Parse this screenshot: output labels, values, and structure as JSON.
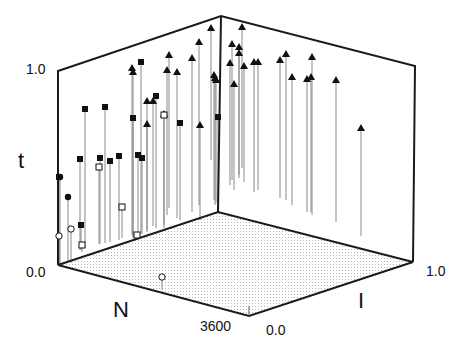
{
  "chart_data": {
    "type": "scatter",
    "subtype": "3d-stem",
    "title": "",
    "axes": {
      "x": {
        "label": "N",
        "ticks": [
          "3600"
        ],
        "range_hint": [
          0,
          3600
        ]
      },
      "y": {
        "label": "I",
        "ticks": [
          "0.0",
          "1.0"
        ],
        "range": [
          0.0,
          1.0
        ]
      },
      "z": {
        "label": "t",
        "ticks": [
          "0.0",
          "1.0"
        ],
        "range": [
          0.0,
          1.0
        ]
      }
    },
    "legend": [],
    "grid": false,
    "floor": "dotted",
    "marker_types": [
      "filled-triangle",
      "filled-square",
      "open-square",
      "filled-circle",
      "open-circle"
    ],
    "frame": {
      "top_left": [
        58,
        71
      ],
      "top_back": [
        221,
        16
      ],
      "top_right": [
        415,
        66
      ],
      "bottom_left": [
        58,
        265
      ],
      "bottom_back": [
        218,
        212
      ],
      "bottom_front": [
        249,
        316
      ],
      "bottom_right": [
        413,
        262
      ]
    },
    "points": [
      {
        "m": "tri",
        "x": 211,
        "y": 28,
        "base": 160
      },
      {
        "m": "tri",
        "x": 242,
        "y": 27,
        "base": 168
      },
      {
        "m": "tri",
        "x": 239,
        "y": 47,
        "base": 175
      },
      {
        "m": "tri",
        "x": 239,
        "y": 53,
        "base": 178
      },
      {
        "m": "tri",
        "x": 244,
        "y": 66,
        "base": 182
      },
      {
        "m": "tri",
        "x": 258,
        "y": 62,
        "base": 190
      },
      {
        "m": "tri",
        "x": 286,
        "y": 54,
        "base": 200
      },
      {
        "m": "tri",
        "x": 292,
        "y": 77,
        "base": 205
      },
      {
        "m": "tri",
        "x": 307,
        "y": 79,
        "base": 212
      },
      {
        "m": "tri",
        "x": 312,
        "y": 57,
        "base": 215
      },
      {
        "m": "tri",
        "x": 336,
        "y": 80,
        "base": 222
      },
      {
        "m": "tri",
        "x": 361,
        "y": 128,
        "base": 236
      },
      {
        "m": "tri",
        "x": 132,
        "y": 68,
        "base": 235
      },
      {
        "m": "tri",
        "x": 133,
        "y": 72,
        "base": 238
      },
      {
        "m": "tri",
        "x": 169,
        "y": 55,
        "base": 208
      },
      {
        "m": "tri",
        "x": 167,
        "y": 70,
        "base": 215
      },
      {
        "m": "tri",
        "x": 177,
        "y": 72,
        "base": 218
      },
      {
        "m": "tri",
        "x": 192,
        "y": 58,
        "base": 212
      },
      {
        "m": "tri",
        "x": 199,
        "y": 42,
        "base": 205
      },
      {
        "m": "tri",
        "x": 147,
        "y": 101,
        "base": 230
      },
      {
        "m": "tri",
        "x": 153,
        "y": 101,
        "base": 226
      },
      {
        "m": "tri",
        "x": 147,
        "y": 124,
        "base": 232
      },
      {
        "m": "tri",
        "x": 164,
        "y": 114,
        "base": 225
      },
      {
        "m": "tri",
        "x": 200,
        "y": 125,
        "base": 220
      },
      {
        "m": "tri",
        "x": 214,
        "y": 75,
        "base": 200
      },
      {
        "m": "tri",
        "x": 216,
        "y": 80,
        "base": 203
      },
      {
        "m": "tri",
        "x": 215,
        "y": 78,
        "base": 205
      },
      {
        "m": "tri",
        "x": 230,
        "y": 63,
        "base": 185
      },
      {
        "m": "tri",
        "x": 234,
        "y": 84,
        "base": 190
      },
      {
        "m": "tri",
        "x": 232,
        "y": 44,
        "base": 180
      },
      {
        "m": "tri",
        "x": 254,
        "y": 62,
        "base": 192
      },
      {
        "m": "tri",
        "x": 280,
        "y": 60,
        "base": 198
      },
      {
        "m": "tri",
        "x": 311,
        "y": 77,
        "base": 212
      },
      {
        "m": "sqf",
        "x": 141,
        "y": 62,
        "base": 233
      },
      {
        "m": "sqf",
        "x": 85,
        "y": 109,
        "base": 248
      },
      {
        "m": "sqf",
        "x": 105,
        "y": 107,
        "base": 243
      },
      {
        "m": "sqf",
        "x": 133,
        "y": 118,
        "base": 236
      },
      {
        "m": "sqf",
        "x": 156,
        "y": 96,
        "base": 228
      },
      {
        "m": "sqf",
        "x": 80,
        "y": 159,
        "base": 250
      },
      {
        "m": "sqf",
        "x": 110,
        "y": 161,
        "base": 242
      },
      {
        "m": "sqf",
        "x": 119,
        "y": 156,
        "base": 240
      },
      {
        "m": "sqf",
        "x": 138,
        "y": 155,
        "base": 236
      },
      {
        "m": "sqf",
        "x": 142,
        "y": 158,
        "base": 234
      },
      {
        "m": "sqf",
        "x": 81,
        "y": 225,
        "base": 250
      },
      {
        "m": "sqf",
        "x": 218,
        "y": 117,
        "base": 210
      },
      {
        "m": "sqf",
        "x": 180,
        "y": 123,
        "base": 220
      },
      {
        "m": "sqf",
        "x": 100,
        "y": 158,
        "base": 244
      },
      {
        "m": "sqf",
        "x": 59,
        "y": 177,
        "base": 265
      },
      {
        "m": "sqo",
        "x": 99,
        "y": 167,
        "base": 244
      },
      {
        "m": "sqo",
        "x": 122,
        "y": 207,
        "base": 238
      },
      {
        "m": "sqo",
        "x": 82,
        "y": 245,
        "base": 252
      },
      {
        "m": "sqo",
        "x": 137,
        "y": 235,
        "base": 235
      },
      {
        "m": "sqo",
        "x": 164,
        "y": 115,
        "base": 228
      },
      {
        "m": "cf",
        "x": 60,
        "y": 177,
        "base": 266
      },
      {
        "m": "cf",
        "x": 68,
        "y": 197,
        "base": 262
      },
      {
        "m": "co",
        "x": 59,
        "y": 236,
        "base": 266
      },
      {
        "m": "co",
        "x": 71,
        "y": 229,
        "base": 263
      },
      {
        "m": "co",
        "x": 162,
        "y": 277,
        "base": 290
      }
    ]
  },
  "labels": {
    "z_axis": "t",
    "z_tick_top": "1.0",
    "z_tick_bottom": "0.0",
    "x_axis": "N",
    "x_tick": "3600",
    "y_axis": "I",
    "y_tick_front": "0.0",
    "y_tick_back": "1.0"
  },
  "colors": {
    "frame": "#1a1a1a",
    "stem": "#8a8a8a",
    "marker": "#111111",
    "floor_dot": "#b5b5b5"
  }
}
